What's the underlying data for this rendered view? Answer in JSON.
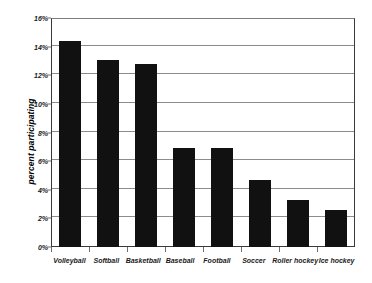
{
  "chart_data": {
    "type": "bar",
    "title": "",
    "xlabel": "",
    "ylabel": "percent participating",
    "categories": [
      "Volleyball",
      "Softball",
      "Basketball",
      "Baseball",
      "Football",
      "Soccer",
      "Roller hockey",
      "Ice hockey"
    ],
    "values": [
      14.4,
      13.1,
      12.8,
      6.9,
      6.9,
      4.7,
      3.3,
      2.6
    ],
    "ylim": [
      0,
      16
    ],
    "ytick_values": [
      0,
      2,
      4,
      6,
      8,
      10,
      12,
      14,
      16
    ],
    "ytick_labels": [
      "0%",
      "2%",
      "4%",
      "6%",
      "8%",
      "10%",
      "12%",
      "14%",
      "16%"
    ],
    "grid": true,
    "legend": "none",
    "bar_color": "#111111",
    "background_color": "#ffffff",
    "gridline_color": "#8c8c8c",
    "axis_color": "#3a3a3a"
  }
}
